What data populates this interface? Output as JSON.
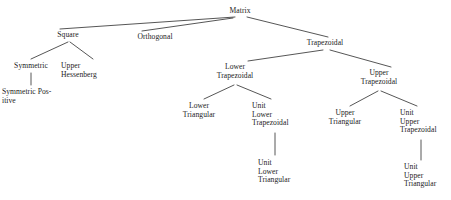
{
  "diagram": {
    "title": "Matrix",
    "type": "tree",
    "canvas": {
      "width": 451,
      "height": 200
    },
    "style": {
      "line_color": "#2b2b2b",
      "text_color": "#1c1c1c",
      "background": "#ffffff"
    },
    "nodes": [
      {
        "id": "matrix",
        "lines": [
          "Matrix"
        ],
        "x": 240,
        "y": 7,
        "align": "center"
      },
      {
        "id": "square",
        "lines": [
          "Square"
        ],
        "x": 68,
        "y": 31,
        "align": "center"
      },
      {
        "id": "orthogonal",
        "lines": [
          "Orthogonal"
        ],
        "x": 155,
        "y": 33,
        "align": "center"
      },
      {
        "id": "trapezoidal",
        "lines": [
          "Trapezoidal"
        ],
        "x": 325,
        "y": 39,
        "align": "center"
      },
      {
        "id": "symmetric",
        "lines": [
          "Symmetric"
        ],
        "x": 31,
        "y": 62,
        "align": "center"
      },
      {
        "id": "upper-hessenberg",
        "lines": [
          "Upper",
          "Hessenberg"
        ],
        "x": 61,
        "y": 62,
        "align": "left"
      },
      {
        "id": "symmetric-positive",
        "lines": [
          "Symmetric Pos-",
          "itive"
        ],
        "x": 2,
        "y": 88,
        "align": "left"
      },
      {
        "id": "lower-trapezoidal",
        "lines": [
          "Lower",
          "Trapezoidal"
        ],
        "x": 235,
        "y": 63,
        "align": "center"
      },
      {
        "id": "upper-trapezoidal",
        "lines": [
          "Upper",
          "Trapezoidal"
        ],
        "x": 379,
        "y": 69,
        "align": "center"
      },
      {
        "id": "lower-triangular",
        "lines": [
          "Lower",
          "Triangular"
        ],
        "x": 199,
        "y": 102,
        "align": "center"
      },
      {
        "id": "unit-lower-trapezoidal",
        "lines": [
          "Unit",
          "Lower",
          "Trapezoidal"
        ],
        "x": 252,
        "y": 102,
        "align": "left"
      },
      {
        "id": "upper-triangular",
        "lines": [
          "Upper",
          "Triangular"
        ],
        "x": 345,
        "y": 109,
        "align": "center"
      },
      {
        "id": "unit-upper-trapezoidal",
        "lines": [
          "Unit",
          "Upper",
          "Trapezoidal"
        ],
        "x": 400,
        "y": 109,
        "align": "left"
      },
      {
        "id": "unit-lower-triangular",
        "lines": [
          "Unit",
          "Lower",
          "Triangular"
        ],
        "x": 258,
        "y": 159,
        "align": "left"
      },
      {
        "id": "unit-upper-triangular",
        "lines": [
          "Unit",
          "Upper",
          "Triangular"
        ],
        "x": 404,
        "y": 163,
        "align": "left"
      }
    ],
    "edges": [
      {
        "from": "matrix",
        "to": "square",
        "x1": 235,
        "y1": 17,
        "x2": 60,
        "y2": 29
      },
      {
        "from": "matrix",
        "to": "orthogonal",
        "x1": 233,
        "y1": 18,
        "x2": 142,
        "y2": 31
      },
      {
        "from": "matrix",
        "to": "trapezoidal",
        "x1": 247,
        "y1": 17,
        "x2": 328,
        "y2": 37
      },
      {
        "from": "square",
        "to": "symmetric",
        "x1": 68,
        "y1": 42,
        "x2": 31,
        "y2": 59
      },
      {
        "from": "square",
        "to": "upper-hessenberg",
        "x1": 70,
        "y1": 42,
        "x2": 93,
        "y2": 59
      },
      {
        "from": "symmetric",
        "to": "symmetric-positive",
        "x1": 31,
        "y1": 73,
        "x2": 31,
        "y2": 85
      },
      {
        "from": "trapezoidal",
        "to": "lower-trapezoidal",
        "x1": 323,
        "y1": 50,
        "x2": 248,
        "y2": 61
      },
      {
        "from": "trapezoidal",
        "to": "upper-trapezoidal",
        "x1": 330,
        "y1": 50,
        "x2": 391,
        "y2": 67
      },
      {
        "from": "lower-trapezoidal",
        "to": "lower-triangular",
        "x1": 234,
        "y1": 85,
        "x2": 204,
        "y2": 99
      },
      {
        "from": "lower-trapezoidal",
        "to": "unit-lower-trapezoidal",
        "x1": 237,
        "y1": 85,
        "x2": 271,
        "y2": 99
      },
      {
        "from": "upper-trapezoidal",
        "to": "upper-triangular",
        "x1": 378,
        "y1": 91,
        "x2": 350,
        "y2": 106
      },
      {
        "from": "upper-trapezoidal",
        "to": "unit-upper-trapezoidal",
        "x1": 381,
        "y1": 91,
        "x2": 417,
        "y2": 106
      },
      {
        "from": "unit-lower-trapezoidal",
        "to": "unit-lower-triangular",
        "x1": 275,
        "y1": 133,
        "x2": 275,
        "y2": 155
      },
      {
        "from": "unit-upper-trapezoidal",
        "to": "unit-upper-triangular",
        "x1": 421,
        "y1": 140,
        "x2": 421,
        "y2": 160
      }
    ]
  }
}
